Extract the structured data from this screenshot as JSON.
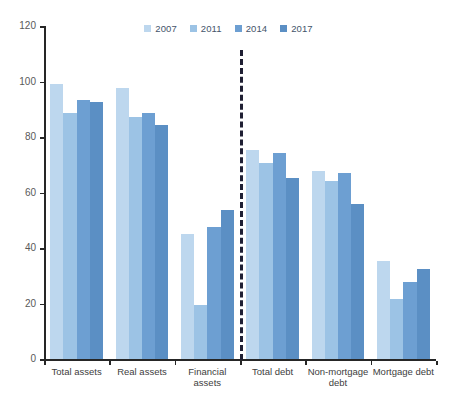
{
  "chart_data": {
    "type": "bar",
    "title": "",
    "subtitle": "",
    "xlabel": "",
    "ylabel": "",
    "ylim": [
      0,
      120
    ],
    "ytick_labels": [
      "0",
      "20",
      "40",
      "60",
      "80",
      "100",
      "120"
    ],
    "yticks": [
      0,
      20,
      40,
      60,
      80,
      100,
      120
    ],
    "grid": false,
    "legend_position": "top-center",
    "categories": [
      "Total assets",
      "Real assets",
      "Financial assets",
      "Total debt",
      "Non-mortgage\ndebt",
      "Mortgage debt"
    ],
    "series": [
      {
        "name": "2007",
        "color": "#bdd7ee",
        "values": [
          99.0,
          97.7,
          45.0,
          75.5,
          67.8,
          35.3
        ]
      },
      {
        "name": "2011",
        "color": "#9cc3e5",
        "values": [
          88.6,
          87.3,
          19.5,
          70.7,
          64.2,
          21.8
        ]
      },
      {
        "name": "2014",
        "color": "#6d9fd2",
        "values": [
          93.2,
          88.7,
          47.6,
          74.3,
          67.2,
          27.8
        ]
      },
      {
        "name": "2017",
        "color": "#5b8fc4",
        "values": [
          92.6,
          84.3,
          53.8,
          65.4,
          55.8,
          32.6
        ]
      }
    ],
    "annotations": [
      {
        "name": "assets-debt-divider",
        "type": "vertical-dashed-line",
        "after_category": "Financial assets"
      }
    ]
  },
  "legend": {
    "items": [
      {
        "label": "2007",
        "color": "#bdd7ee"
      },
      {
        "label": "2011",
        "color": "#9cc3e5"
      },
      {
        "label": "2014",
        "color": "#6d9fd2"
      },
      {
        "label": "2017",
        "color": "#5b8fc4"
      }
    ]
  },
  "axis": {
    "y_labels": [
      "120",
      "100",
      "80",
      "60",
      "40",
      "20",
      "0"
    ]
  }
}
